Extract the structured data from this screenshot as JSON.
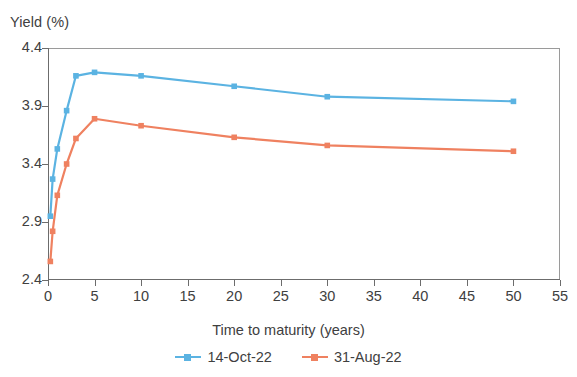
{
  "chart_data": {
    "type": "line",
    "title": "",
    "xlabel": "Time to maturity (years)",
    "ylabel": "Yield (%)",
    "xlim": [
      0,
      55
    ],
    "ylim": [
      2.4,
      4.4
    ],
    "xticks": [
      0,
      5,
      10,
      15,
      20,
      25,
      30,
      35,
      40,
      45,
      50,
      55
    ],
    "yticks": [
      2.4,
      2.9,
      3.4,
      3.9,
      4.4
    ],
    "xtick_labels": [
      "0",
      "5",
      "10",
      "15",
      "20",
      "25",
      "30",
      "35",
      "40",
      "45",
      "50",
      "55"
    ],
    "ytick_labels": [
      "2.4",
      "2.9",
      "3.4",
      "3.9",
      "4.4"
    ],
    "grid": false,
    "legend_position": "bottom",
    "series": [
      {
        "name": "14-Oct-22",
        "color": "#5BB3E2",
        "marker": "square",
        "x": [
          0.25,
          0.5,
          1,
          2,
          3,
          5,
          10,
          20,
          30,
          50
        ],
        "values": [
          2.95,
          3.27,
          3.53,
          3.86,
          4.16,
          4.19,
          4.16,
          4.07,
          3.98,
          3.94
        ]
      },
      {
        "name": "31-Aug-22",
        "color": "#EF8160",
        "marker": "square",
        "x": [
          0.25,
          0.5,
          1,
          2,
          3,
          5,
          10,
          20,
          30,
          50
        ],
        "values": [
          2.56,
          2.82,
          3.13,
          3.4,
          3.62,
          3.79,
          3.73,
          3.63,
          3.56,
          3.51
        ]
      }
    ]
  },
  "axes": {
    "y_title": "Yield (%)",
    "x_title": "Time to maturity (years)"
  },
  "legend": {
    "items": [
      {
        "label": "14-Oct-22",
        "color": "#5BB3E2"
      },
      {
        "label": "31-Aug-22",
        "color": "#EF8160"
      }
    ]
  }
}
